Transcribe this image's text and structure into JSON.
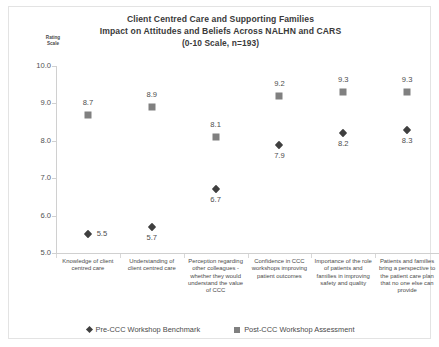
{
  "chart_data": {
    "type": "scatter",
    "title": "Client Centred Care and Supporting Families",
    "subtitle": "Impact on Attitudes and Beliefs Across NALHN and CARS",
    "subtitle2": "(0-10 Scale,  n=193)",
    "ylabel": "Rating Scale",
    "ylabel_line1": "Rating",
    "ylabel_line2": "Scale",
    "xlabel": "",
    "ylim": [
      5.0,
      10.0
    ],
    "ytick_labels": [
      "10.0",
      "9.0",
      "8.0",
      "7.0",
      "6.0",
      "5.0"
    ],
    "ytick_values": [
      10.0,
      9.0,
      8.0,
      7.0,
      6.0,
      5.0
    ],
    "grid": false,
    "legend_position": "bottom",
    "categories": [
      "Knowledge of client centred care",
      "Understanding of client centred care",
      "Perception regarding other colleagues - whether they would understand the value of CCC",
      "Confidence in CCC workshops improving patient outcomes",
      "Importance of the role of patients and families in improving safety and quality",
      "Patients and families bring a perspective to the patient care plan that no one else can provide"
    ],
    "series": [
      {
        "name": "Pre-CCC Workshop Benchmark",
        "marker": "diamond",
        "color": "#3f3f3f",
        "values": [
          5.5,
          5.7,
          6.7,
          7.9,
          8.2,
          8.3
        ],
        "labels": [
          "5.5",
          "5.7",
          "6.7",
          "7.9",
          "8.2",
          "8.3"
        ]
      },
      {
        "name": "Post-CCC Workshop Assessment",
        "marker": "square",
        "color": "#808080",
        "values": [
          8.7,
          8.9,
          8.1,
          9.2,
          9.3,
          9.3
        ],
        "labels": [
          "8.7",
          "8.9",
          "8.1",
          "9.2",
          "9.3",
          "9.3"
        ]
      }
    ]
  },
  "legend": {
    "items": [
      {
        "label": "Pre-CCC Workshop Benchmark"
      },
      {
        "label": "Post-CCC Workshop Assessment"
      }
    ]
  }
}
